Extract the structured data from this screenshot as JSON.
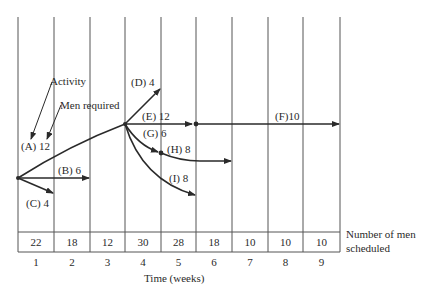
{
  "diagram": {
    "annotations": {
      "activity_label": "Activity",
      "men_required_label": "Men required"
    },
    "activities": [
      {
        "id": "A",
        "label": "(A) 12",
        "men": 12
      },
      {
        "id": "B",
        "label": "(B) 6",
        "men": 6
      },
      {
        "id": "C",
        "label": "(C) 4",
        "men": 4
      },
      {
        "id": "D",
        "label": "(D) 4",
        "men": 4
      },
      {
        "id": "E",
        "label": "(E) 12",
        "men": 12
      },
      {
        "id": "F",
        "label": "(F)10",
        "men": 10
      },
      {
        "id": "G",
        "label": "(G) 6",
        "men": 6
      },
      {
        "id": "H",
        "label": "(H) 8",
        "men": 8
      },
      {
        "id": "I",
        "label": "(I) 8",
        "men": 8
      }
    ],
    "schedule": {
      "row_label_line1": "Number of men",
      "row_label_line2": "scheduled",
      "men_scheduled": [
        "22",
        "18",
        "12",
        "30",
        "28",
        "18",
        "10",
        "10",
        "10"
      ],
      "weeks": [
        "1",
        "2",
        "3",
        "4",
        "5",
        "6",
        "7",
        "8",
        "9"
      ]
    },
    "x_axis_label": "Time (weeks)",
    "colors": {
      "line": "#2a2a2a",
      "grid": "#555555",
      "background": "#ffffff"
    }
  }
}
